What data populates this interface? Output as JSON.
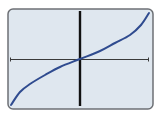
{
  "colors": {
    "page_bg": "#ffffff",
    "screen_bg": "#dfe7ef",
    "frame": "#6d7075",
    "curve": "#2f4b8f",
    "x_axis": "#3a3a3a",
    "y_axis": "#111111"
  },
  "chart_data": {
    "type": "line",
    "title": "",
    "xlabel": "",
    "ylabel": "",
    "grid": false,
    "legend": null,
    "x": [
      -1.0,
      -0.87,
      -0.72,
      -0.51,
      -0.29,
      0.0,
      0.29,
      0.51,
      0.72,
      0.87,
      1.0
    ],
    "series": [
      {
        "name": "f(x)",
        "values": [
          -1.0,
          -0.72,
          -0.54,
          -0.35,
          -0.17,
          0.0,
          0.17,
          0.35,
          0.54,
          0.72,
          1.0
        ]
      }
    ],
    "xlim": [
      -1,
      1
    ],
    "ylim": [
      -1,
      1
    ]
  },
  "plot": {
    "frame": {
      "x": 8,
      "y": 9,
      "w": 145,
      "h": 100,
      "radius": 5
    },
    "origin_px": [
      80,
      59
    ],
    "x_axis_px": {
      "x1": 10,
      "x2": 149,
      "y": 59
    },
    "y_axis_px": {
      "x": 80,
      "y1": 11,
      "y2": 106
    },
    "curve_points_px": [
      [
        11,
        105
      ],
      [
        20,
        92
      ],
      [
        30,
        84
      ],
      [
        45,
        75
      ],
      [
        60,
        67
      ],
      [
        80,
        59
      ],
      [
        100,
        51
      ],
      [
        115,
        43
      ],
      [
        130,
        35
      ],
      [
        141,
        25
      ],
      [
        149,
        13
      ]
    ]
  }
}
